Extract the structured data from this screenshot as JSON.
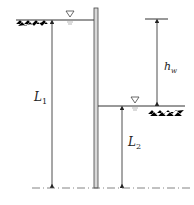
{
  "diagram": {
    "colors": {
      "line": "#333333",
      "wall_fill": "#d8d8d8",
      "hatch": "#aaaaaa",
      "dashdot": "#666666"
    },
    "labels": {
      "L1": {
        "main": "L",
        "sub": "1"
      },
      "L2": {
        "main": "L",
        "sub": "2"
      },
      "hw": {
        "main": "h",
        "sub": "w"
      }
    },
    "symbols": {
      "left_water_level": "water-level-triangle",
      "right_water_level": "water-level-triangle"
    }
  }
}
